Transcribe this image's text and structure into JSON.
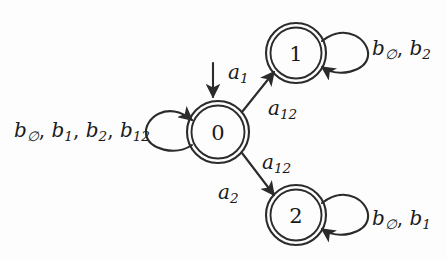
{
  "diagram": {
    "type": "finite-state-automaton",
    "background_color": "#fdfdfd",
    "stroke_color": "#2b2b2b",
    "states": [
      {
        "id": "0",
        "label": "0",
        "accepting": true,
        "cx": 218,
        "cy": 132,
        "r": 31
      },
      {
        "id": "1",
        "label": "1",
        "accepting": true,
        "cx": 296,
        "cy": 53,
        "r": 30
      },
      {
        "id": "2",
        "label": "2",
        "accepting": true,
        "cx": 296,
        "cy": 215,
        "r": 30
      }
    ],
    "initial_transition": {
      "target": "0",
      "direction": "down",
      "label_base": "a",
      "label_sub": "1"
    },
    "self_loops": [
      {
        "state": "0",
        "side": "left",
        "labels": [
          {
            "base": "b",
            "sub": "∅"
          },
          {
            "base": "b",
            "sub": "1"
          },
          {
            "base": "b",
            "sub": "2"
          },
          {
            "base": "b",
            "sub": "12"
          }
        ]
      },
      {
        "state": "1",
        "side": "right",
        "labels": [
          {
            "base": "b",
            "sub": "∅"
          },
          {
            "base": "b",
            "sub": "2"
          }
        ]
      },
      {
        "state": "2",
        "side": "right",
        "labels": [
          {
            "base": "b",
            "sub": "∅"
          },
          {
            "base": "b",
            "sub": "1"
          }
        ]
      }
    ],
    "transitions": [
      {
        "from": "0",
        "to": "1",
        "labels": [
          {
            "base": "a",
            "sub": "12"
          }
        ]
      },
      {
        "from": "0",
        "to": "2",
        "labels": [
          {
            "base": "a",
            "sub": "12"
          },
          {
            "base": "a",
            "sub": "2"
          }
        ]
      }
    ],
    "separator": ","
  }
}
